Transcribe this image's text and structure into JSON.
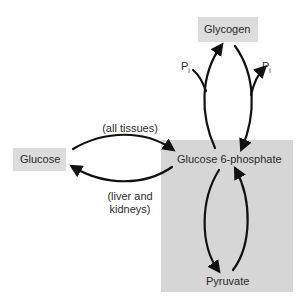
{
  "nodes": {
    "glycogen": "Glycogen",
    "glucose": "Glucose",
    "glucose6p": "Glucose 6-phosphate",
    "pyruvate": "Pyruvate"
  },
  "edges": {
    "upper_caption": "(all tissues)",
    "lower_caption_line1": "(liver and",
    "lower_caption_line2": "kidneys)",
    "pi_left": "P",
    "pi_left_sub": "i",
    "pi_right": "P",
    "pi_right_sub": "i"
  },
  "colors": {
    "box_fill": "#dcdcdc",
    "large_region_fill": "#d6d6d6",
    "arrow": "#111111"
  }
}
